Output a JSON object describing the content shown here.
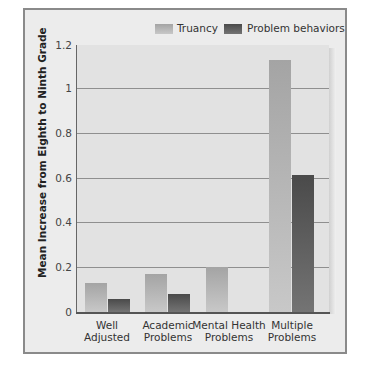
{
  "chart_data": {
    "type": "bar",
    "title": "",
    "xlabel": "",
    "ylabel": "Mean Increase from Eighth to Ninth Grade",
    "ylim": [
      0,
      1.2
    ],
    "yticks": [
      "0",
      "0.2",
      "0.4",
      "0.6",
      "0.8",
      "1",
      "1.2"
    ],
    "grid": true,
    "legend_position": "top-right",
    "categories": [
      "Well Adjusted",
      "Academic Problems",
      "Mental Health Problems",
      "Multiple Problems"
    ],
    "category_lines": [
      [
        "Well",
        "Adjusted"
      ],
      [
        "Academic",
        "Problems"
      ],
      [
        "Mental Health",
        "Problems"
      ],
      [
        "Multiple",
        "Problems"
      ]
    ],
    "series": [
      {
        "name": "Truancy",
        "color": "#b0b0b0",
        "values": [
          0.13,
          0.17,
          0.2,
          1.12
        ]
      },
      {
        "name": "Problem behaviors",
        "color": "#555555",
        "values": [
          0.06,
          0.08,
          0.0,
          0.61
        ]
      }
    ]
  }
}
